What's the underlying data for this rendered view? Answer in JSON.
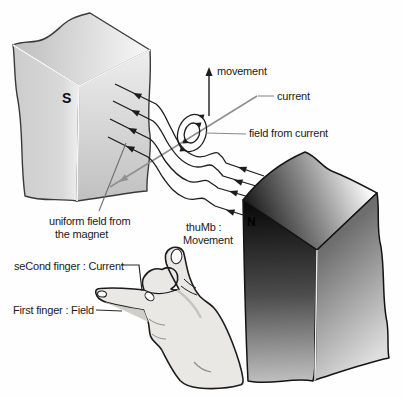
{
  "diagram": {
    "labels": {
      "movement": "movement",
      "current": "current",
      "field_from_current": "field from current",
      "uniform_field_line1": "uniform field from",
      "uniform_field_line2": "the magnet",
      "thumb_mnemonic_line1": "thuMb :",
      "thumb_mnemonic_line2": "Movement",
      "second_finger_mnemonic": "seCond finger : Current",
      "first_finger_mnemonic": "First finger : Field",
      "south_pole": "S",
      "north_pole": "N"
    },
    "colors": {
      "background": "#fefefe",
      "field_line": "#1c1c1c",
      "wire": "#909090",
      "leader_gray": "#8a8a8a",
      "leader_dark": "#2a2a2a",
      "hand_fill": "#eae8e4",
      "hand_shadow": "#d0cec9",
      "text": "#1a1a1a"
    }
  }
}
